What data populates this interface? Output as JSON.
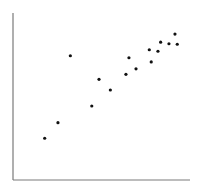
{
  "chart_data": {
    "type": "scatter",
    "title": "",
    "xlabel": "",
    "ylabel": "",
    "xlim": [
      0,
      10
    ],
    "ylim": [
      0,
      10
    ],
    "grid": false,
    "legend": null,
    "ticks": {
      "x": [],
      "y": []
    },
    "series": [
      {
        "name": "points",
        "color": "#111111",
        "x": [
          1.79,
          2.54,
          3.24,
          4.45,
          4.86,
          5.5,
          6.38,
          6.55,
          6.95,
          7.7,
          7.81,
          8.19,
          8.34,
          8.81,
          9.15,
          9.28
        ],
        "y": [
          2.5,
          3.43,
          7.44,
          4.43,
          6.03,
          5.39,
          6.33,
          7.32,
          6.66,
          7.8,
          7.07,
          7.71,
          8.25,
          8.16,
          8.74,
          8.13
        ]
      }
    ]
  },
  "layout": {
    "plot_left": 13,
    "plot_right": 190,
    "plot_top": 13,
    "plot_bottom": 180,
    "axis_color": "#7a7a7a",
    "point_radius": 1.6
  }
}
